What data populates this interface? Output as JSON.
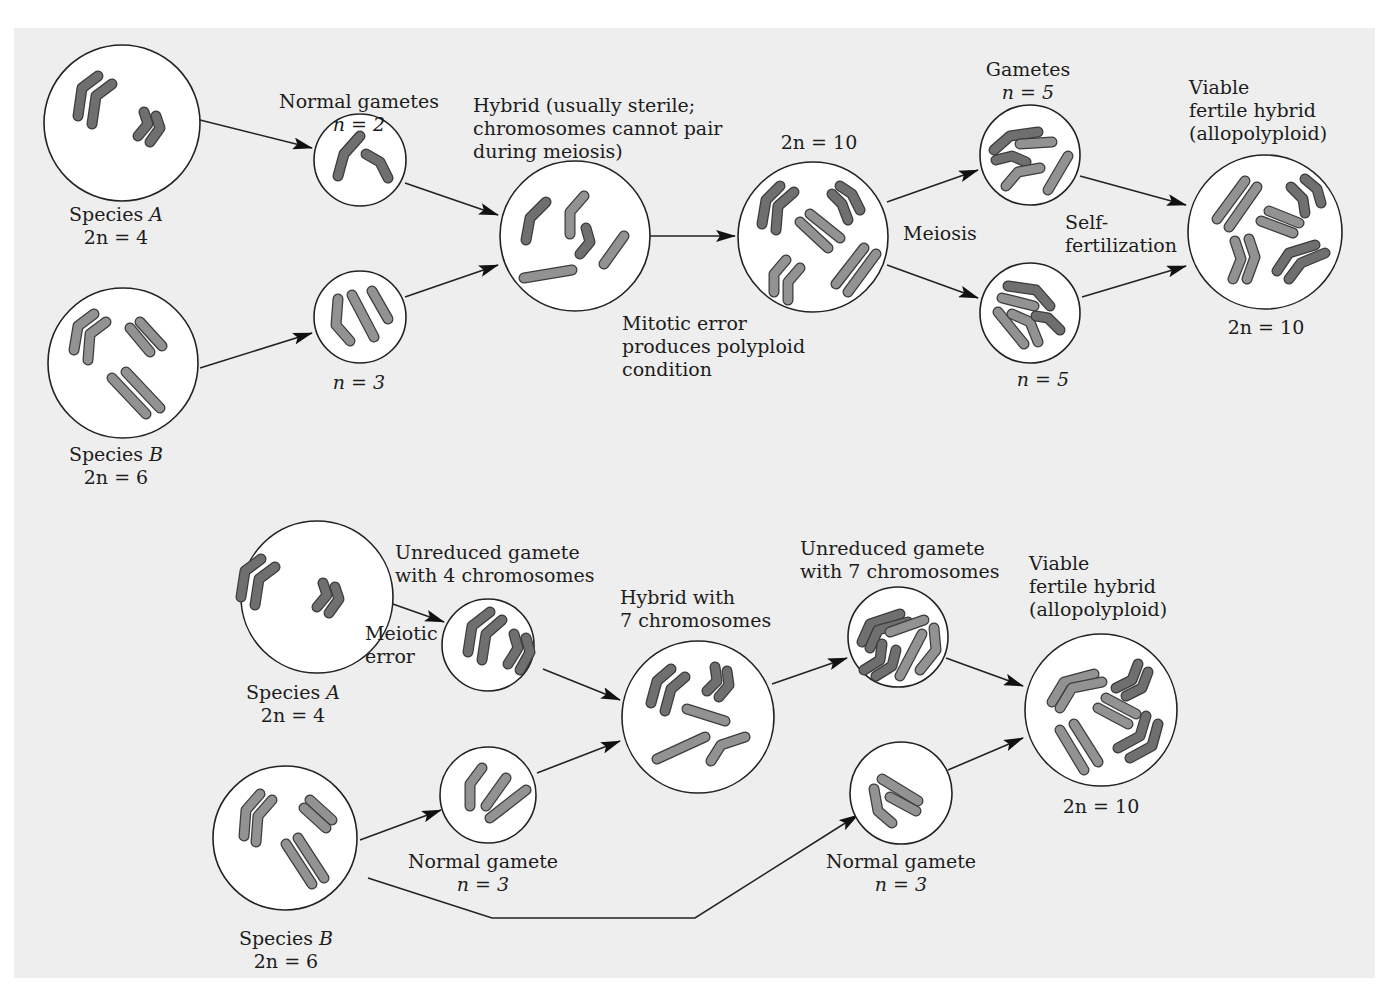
{
  "figure": {
    "colors": {
      "background": "#eeeeee",
      "page": "#ffffff",
      "cell_fill": "#ffffff",
      "outline": "#222222",
      "species_a_chromosome": "#6f6f6f",
      "species_b_chromosome": "#929292",
      "chromosome_outline": "#3c3c3c"
    },
    "top": {
      "species_a": {
        "name": "Species",
        "letter": "A",
        "ploidy": "2n = 4"
      },
      "species_b": {
        "name": "Species",
        "letter": "B",
        "ploidy": "2n = 6"
      },
      "normal_gametes": {
        "title": "Normal gametes",
        "n_a": "n = 2",
        "n_b": "n = 3"
      },
      "hybrid": {
        "line1": "Hybrid (usually sterile;",
        "line2": "chromosomes cannot pair",
        "line3": "during meiosis)"
      },
      "mitotic_error": {
        "line1": "Mitotic error",
        "line2": "produces polyploid",
        "line3": "condition"
      },
      "doubled": {
        "ploidy": "2n = 10"
      },
      "meiosis": "Meiosis",
      "gametes": {
        "title": "Gametes",
        "n_top": "n = 5",
        "n_bottom": "n = 5"
      },
      "self_fert": {
        "line1": "Self-",
        "line2": "fertilization"
      },
      "viable": {
        "line1": "Viable",
        "line2": "fertile hybrid",
        "line3": "(allopolyploid)",
        "ploidy": "2n = 10"
      }
    },
    "bottom": {
      "species_a": {
        "name": "Species",
        "letter": "A",
        "ploidy": "2n = 4"
      },
      "species_b": {
        "name": "Species",
        "letter": "B",
        "ploidy": "2n = 6"
      },
      "unreduced_4": {
        "line1": "Unreduced gamete",
        "line2": "with 4 chromosomes"
      },
      "meiotic_error": {
        "line1": "Meiotic",
        "line2": "error"
      },
      "normal_gamete_left": {
        "title": "Normal gamete",
        "n": "n = 3"
      },
      "hybrid_7": {
        "line1": "Hybrid with",
        "line2": "7 chromosomes"
      },
      "unreduced_7": {
        "line1": "Unreduced gamete",
        "line2": "with 7 chromosomes"
      },
      "normal_gamete_right": {
        "title": "Normal gamete",
        "n": "n = 3"
      },
      "viable": {
        "line1": "Viable",
        "line2": "fertile hybrid",
        "line3": "(allopolyploid)",
        "ploidy": "2n = 10"
      }
    }
  }
}
